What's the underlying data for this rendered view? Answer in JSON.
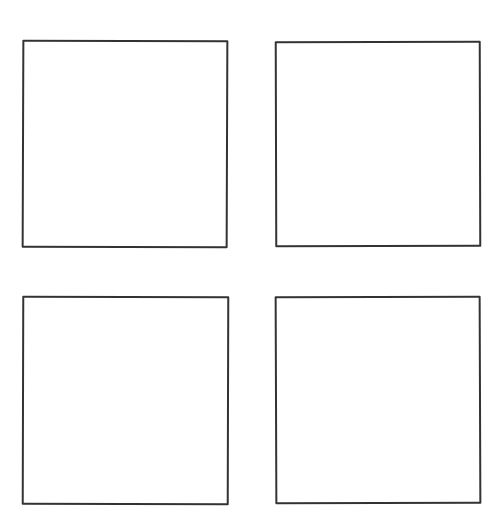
{
  "chart_data": [
    {
      "type": "line",
      "title": "",
      "xlabel": "",
      "ylabel": "",
      "series": [],
      "grid": false,
      "ticks": false,
      "position": "top-left"
    },
    {
      "type": "line",
      "title": "",
      "xlabel": "",
      "ylabel": "",
      "series": [],
      "grid": false,
      "ticks": false,
      "position": "top-right"
    },
    {
      "type": "line",
      "title": "",
      "xlabel": "",
      "ylabel": "",
      "series": [],
      "grid": false,
      "ticks": false,
      "position": "bottom-left"
    },
    {
      "type": "line",
      "title": "",
      "xlabel": "",
      "ylabel": "",
      "series": [],
      "grid": false,
      "ticks": false,
      "position": "bottom-right"
    }
  ],
  "layout": {
    "rows": 2,
    "cols": 2,
    "style": "xkcd-sketch",
    "frame_color": "#333333"
  }
}
